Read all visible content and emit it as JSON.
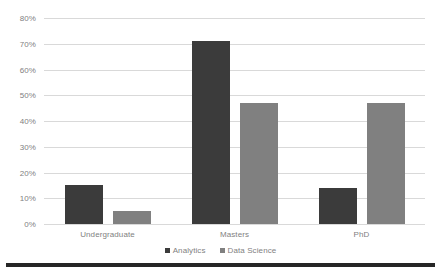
{
  "chart_data": {
    "type": "bar",
    "title": "",
    "subtitle": "",
    "xlabel": "",
    "ylabel": "",
    "categories": [
      "Undergraduate",
      "Masters",
      "PhD"
    ],
    "series": [
      {
        "name": "Analytics",
        "values": [
          15,
          71,
          14
        ],
        "color": "#3b3b3b"
      },
      {
        "name": "Data Science",
        "values": [
          5,
          47,
          47
        ],
        "color": "#808080"
      }
    ],
    "ylim": [
      0,
      80
    ],
    "ytick_values": [
      0,
      10,
      20,
      30,
      40,
      50,
      60,
      70,
      80
    ],
    "ytick_labels": [
      "0%",
      "10%",
      "20%",
      "30%",
      "40%",
      "50%",
      "60%",
      "70%",
      "80%"
    ],
    "value_suffix": "%",
    "grid": {
      "horizontal": true,
      "vertical": false,
      "color": "#d9d9d9"
    },
    "legend": {
      "position": "bottom",
      "marker": "square"
    },
    "plot_background": "#ffffff",
    "axis_label_color": "#7f7f7f"
  },
  "figure": {
    "background": "#ffffff",
    "bottom_rule_color": "#262626"
  }
}
